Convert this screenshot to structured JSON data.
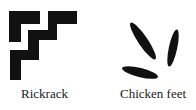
{
  "figures": [
    {
      "id": "rickrack",
      "label": "Rickrack",
      "icon": "rickrack-stair-pattern-icon",
      "color": "#111111"
    },
    {
      "id": "chicken-feet",
      "label": "Chicken feet",
      "icon": "chicken-feet-leaves-icon",
      "color": "#111111"
    }
  ]
}
